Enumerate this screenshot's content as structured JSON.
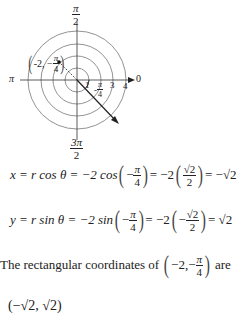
{
  "figure": {
    "type": "polar_graph",
    "angle_labels": {
      "top": {
        "num": "π",
        "den": "2"
      },
      "left": "π",
      "right": "0",
      "bottom": {
        "num": "3π",
        "den": "2"
      }
    },
    "radial_ticks": [
      "1",
      "3",
      "4"
    ],
    "point_label": {
      "r": "-2",
      "theta_num": "π",
      "theta_den": "4"
    },
    "angle_annotation": {
      "sign": "-",
      "num": "π",
      "den": "4"
    },
    "colors": {
      "ink": "#222222",
      "circles": "#777777"
    }
  },
  "equations": {
    "x_eq": {
      "lhs": "x = r cos θ = −2 cos",
      "arg_sign": "−",
      "arg_num": "π",
      "arg_den": "4",
      "mid": "= −2",
      "val_num": "√2",
      "val_den": "2",
      "result": "= −√2"
    },
    "y_eq": {
      "lhs": "y = r sin θ = −2 sin",
      "arg_sign": "−",
      "arg_num": "π",
      "arg_den": "4",
      "mid": "= −2",
      "val_sign": "−",
      "val_num": "√2",
      "val_den": "2",
      "result": "= √2"
    }
  },
  "conclusion": {
    "text_before": "The rectangular coordinates of",
    "coord_r": "−2,",
    "coord_sign": "−",
    "coord_num": "π",
    "coord_den": "4",
    "text_after": "are",
    "partial_line": "(−√2, √2)"
  }
}
